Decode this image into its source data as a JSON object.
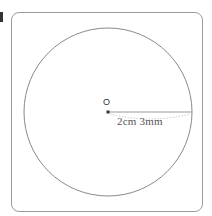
{
  "figure": {
    "center_label": "O",
    "radius_label": "2cm  3mm",
    "colors": {
      "stroke": "#8a8a8a",
      "frame": "#9a9a9a",
      "text": "#555555"
    }
  }
}
